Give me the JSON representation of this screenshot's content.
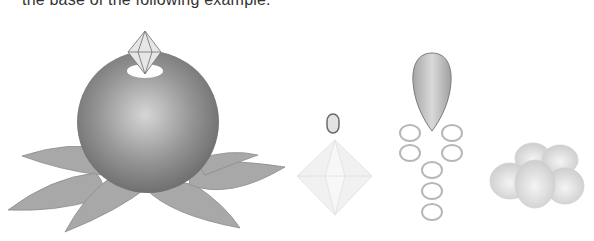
{
  "caption": {
    "text": "the base of the following example."
  },
  "figures": [
    {
      "id": "ornament-on-leaves",
      "description": "Sphere with diamond on top sitting on leaves"
    },
    {
      "id": "bead-and-crystal",
      "description": "Small oval bead above an octahedral crystal"
    },
    {
      "id": "teardrop-with-rings",
      "description": "Teardrop bead above a chain of oval rings"
    },
    {
      "id": "bead-cluster",
      "description": "Cluster of rounded beads"
    }
  ],
  "colors": {
    "sphere_dark": "#6e6e6e",
    "sphere_light": "#d8d8d8",
    "leaf": "#a9a9a9",
    "crystal": "#f2f2f2",
    "ring": "#b5b5b5"
  }
}
